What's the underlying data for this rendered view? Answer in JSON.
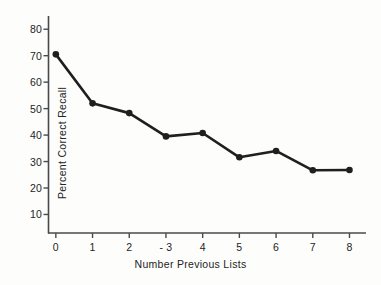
{
  "chart_data": {
    "type": "line",
    "title": "",
    "xlabel": "Number Previous Lists",
    "ylabel": "Percent Correct Recall",
    "x": [
      0,
      1,
      2,
      3,
      4,
      5,
      6,
      7,
      8
    ],
    "values": [
      70.5,
      52.0,
      48.3,
      39.5,
      40.8,
      31.6,
      34.0,
      26.7,
      26.8
    ],
    "series": [
      {
        "name": "Percent Correct Recall",
        "values": [
          70.5,
          52.0,
          48.3,
          39.5,
          40.8,
          31.6,
          34.0,
          26.7,
          26.8
        ]
      }
    ],
    "xtick_labels": [
      "0",
      "1",
      "2",
      "- 3",
      "4",
      "5",
      "6",
      "7",
      "8"
    ],
    "ytick_labels": [
      "10",
      "20",
      "30",
      "40",
      "50",
      "60",
      "70",
      "80"
    ],
    "ytick_values": [
      10,
      20,
      30,
      40,
      50,
      60,
      70,
      80
    ],
    "xlim": [
      -0.2,
      8.45
    ],
    "ylim": [
      3,
      85
    ],
    "grid": false,
    "legend": false,
    "marker": "filled-circle",
    "line_color": "#1f1f1f",
    "marker_color": "#1f1f1f",
    "axis_color": "#4a4a4a",
    "background_color": "#fdfdfc"
  }
}
